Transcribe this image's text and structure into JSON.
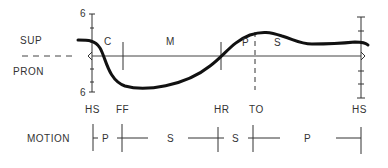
{
  "diagram": {
    "type": "gait-cycle-rotation-diagram",
    "y_axis": {
      "top_label": "SUP",
      "bottom_label": "PRON",
      "top_tick_value": "6",
      "bottom_tick_value": "6"
    },
    "phases_on_curve": [
      "C",
      "M",
      "P",
      "S"
    ],
    "events": [
      {
        "label": "HS",
        "x": 92
      },
      {
        "label": "FF",
        "x": 123
      },
      {
        "label": "HR",
        "x": 221
      },
      {
        "label": "TO",
        "x": 253
      },
      {
        "label": "HS",
        "x": 361
      }
    ],
    "motion_row": {
      "label": "MOTION",
      "segments": [
        "P",
        "S",
        "S",
        "P"
      ]
    },
    "colors": {
      "curve": "#111111",
      "axis": "#333333",
      "text": "#333333"
    }
  }
}
